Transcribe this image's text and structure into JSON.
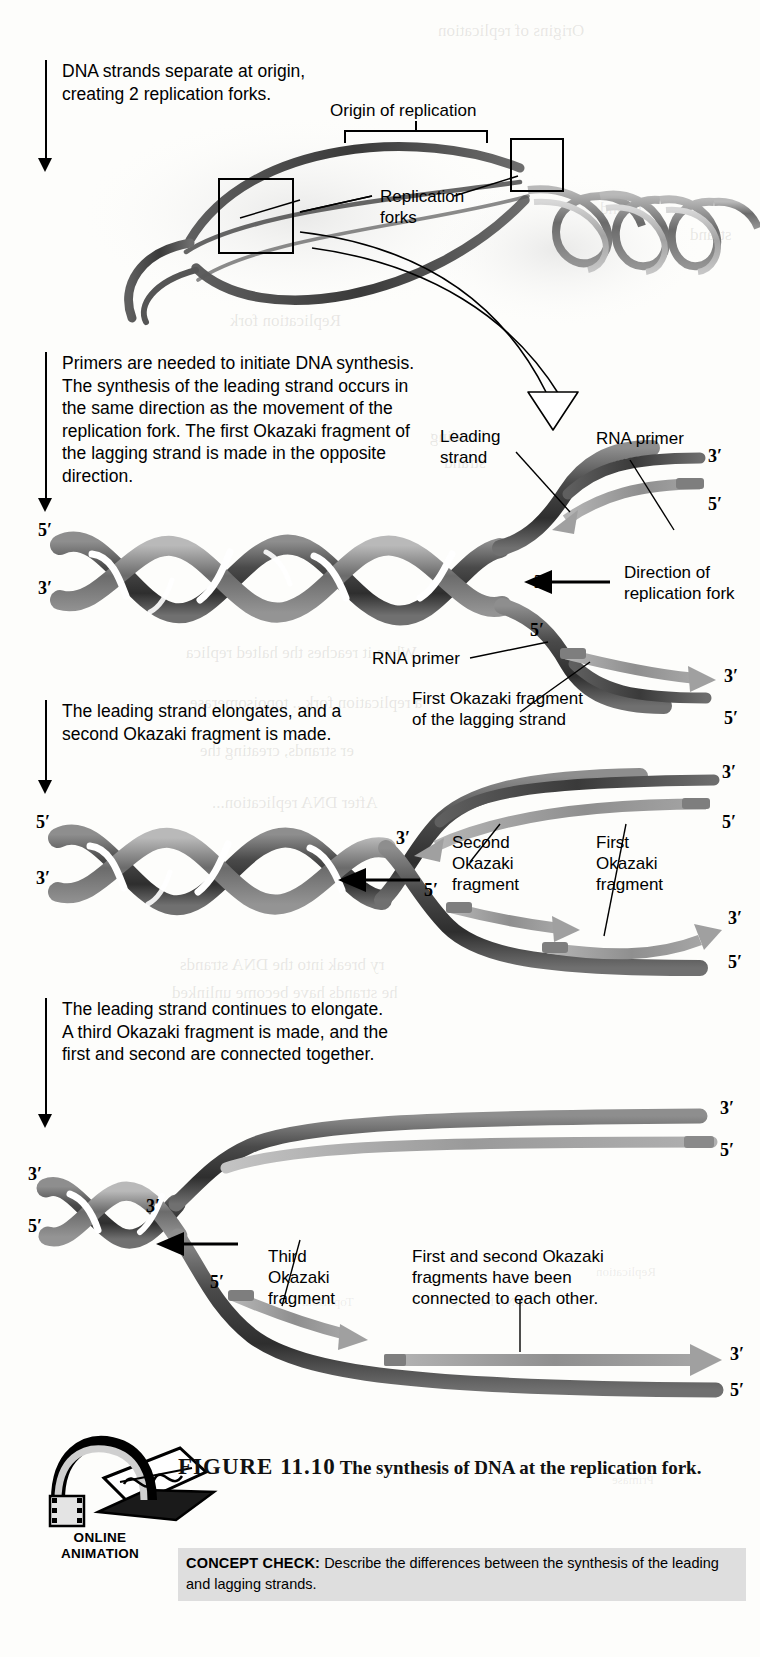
{
  "figure": {
    "number": "FIGURE 11.10",
    "title": "The synthesis of DNA at the replication fork.",
    "animation_badge_line1": "ONLINE",
    "animation_badge_line2": "ANIMATION",
    "concept_check_head": "CONCEPT CHECK:",
    "concept_check_text": "Describe the differences between the synthesis of the leading and lagging strands."
  },
  "steps": [
    {
      "id": "step1",
      "text": "DNA strands separate at origin, creating 2 replication forks."
    },
    {
      "id": "step2",
      "text": "Primers are needed to initiate DNA synthesis. The synthesis of the leading strand occurs in the same direction as the movement of the replication fork. The first Okazaki fragment of the lagging strand is made in the opposite direction."
    },
    {
      "id": "step3",
      "text": "The leading strand elongates, and a second Okazaki fragment is made."
    },
    {
      "id": "step4",
      "text": "The leading strand continues to elongate. A third Okazaki fragment is made, and the first and second are connected together."
    }
  ],
  "panel1": {
    "origin_label": "Origin of replication",
    "forks_label": "Replication\nforks"
  },
  "panel2": {
    "leading_strand_label": "Leading\nstrand",
    "rna_primer_top_label": "RNA primer",
    "rna_primer_bottom_label": "RNA primer",
    "direction_label": "Direction of\nreplication fork",
    "first_okazaki_label": "First Okazaki fragment\nof the lagging strand",
    "primes": {
      "helix_top_left": "5′",
      "helix_bottom_left": "3′",
      "leading_end_3": "3′",
      "leading_end_5": "5′",
      "fork_top_3": "3′",
      "lagging_start_5": "5′",
      "lagging_end_3": "3′",
      "template_end_5": "5′"
    }
  },
  "panel3": {
    "second_okazaki_label": "Second\nOkazaki\nfragment",
    "first_okazaki_label": "First\nOkazaki\nfragment",
    "primes": {
      "helix_top_left": "5′",
      "helix_bottom_left": "3′",
      "leading_end_3": "3′",
      "leading_end_5": "5′",
      "fork_3": "3′",
      "lagging_start_5": "5′",
      "lagging_end_3": "3′",
      "template_end_5": "5′"
    }
  },
  "panel4": {
    "third_okazaki_label": "Third\nOkazaki\nfragment",
    "connected_label": "First and second Okazaki\nfragments have been\nconnected to each other.",
    "primes": {
      "helix_top_left": "3′",
      "helix_bottom_left": "5′",
      "fork_3": "3′",
      "leading_end_3": "3′",
      "leading_end_5": "5′",
      "lagging_start_5": "5′",
      "lagging_end_3": "3′",
      "template_end_5": "5′"
    }
  },
  "bleed_through": {
    "t1": "Origins of replication",
    "t2": "strand",
    "t3": "strand",
    "t4": "Replication fork",
    "t5": "Leading\nstrand",
    "t6": "When it reaches the halted replica",
    "t7": "a replication fork... topoisomerase",
    "t8": "er strands, creating the",
    "t9": "After DNA replication...",
    "t10": "ry break into the DNA strands",
    "t11": "he strands have become unlinked",
    "t12": "Replication",
    "t13": "DNA helicase",
    "t14": "Topoisom",
    "t15": "Primase"
  },
  "colors": {
    "dna_dark": "#3d3d3d",
    "dna_mid": "#6e6e6e",
    "dna_light": "#a9a9a9",
    "primer_gray": "#9b9b9b",
    "ink": "#000000",
    "band_gray": "#dedede"
  }
}
